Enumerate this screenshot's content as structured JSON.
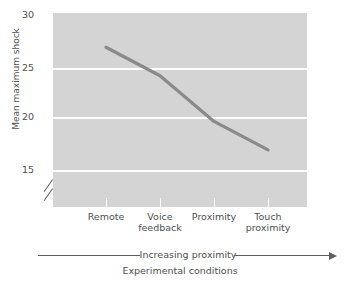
{
  "chart_data": {
    "type": "line",
    "title": "",
    "xlabel": "Experimental conditions",
    "ylabel": "Mean maximum shock",
    "categories": [
      "Remote",
      "Voice feedback",
      "Proximity",
      "Touch proximity"
    ],
    "category_lines": [
      [
        "Remote"
      ],
      [
        "Voice",
        "feedback"
      ],
      [
        "Proximity"
      ],
      [
        "Touch",
        "proximity"
      ]
    ],
    "values": [
      27,
      24.5,
      20.5,
      18
    ],
    "series": [
      {
        "name": "Mean maximum shock",
        "values": [
          27,
          24.5,
          20.5,
          18
        ]
      }
    ],
    "ylim": [
      13,
      30
    ],
    "yticks": [
      30,
      25,
      20,
      15
    ],
    "ytick_labels": [
      "30",
      "25",
      "20",
      "15"
    ],
    "y_axis_break": true,
    "grid": true,
    "grid_axis": "y",
    "legend": "none",
    "annotation_axis_arrow": "Increasing proximity",
    "colors": {
      "panel_background": "#d4d4d4",
      "gridline": "#ffffff",
      "line": "#8a8a8a",
      "text": "#4f4f4f",
      "axis_rule": "#5e5e5e",
      "page_background": "#ffffff"
    }
  },
  "axes": {
    "y_label": "Mean maximum shock",
    "y_ticks": [
      {
        "label": "30",
        "value": 30
      },
      {
        "label": "25",
        "value": 25
      },
      {
        "label": "20",
        "value": 20
      },
      {
        "label": "15",
        "value": 15
      }
    ],
    "x_label": "Experimental conditions",
    "x_ticks": [
      {
        "line1": "Remote",
        "line2": ""
      },
      {
        "line1": "Voice",
        "line2": "feedback"
      },
      {
        "line1": "Proximity",
        "line2": ""
      },
      {
        "line1": "Touch",
        "line2": "proximity"
      }
    ]
  },
  "annotations": {
    "proximity_arrow_text": "Increasing proximity"
  }
}
